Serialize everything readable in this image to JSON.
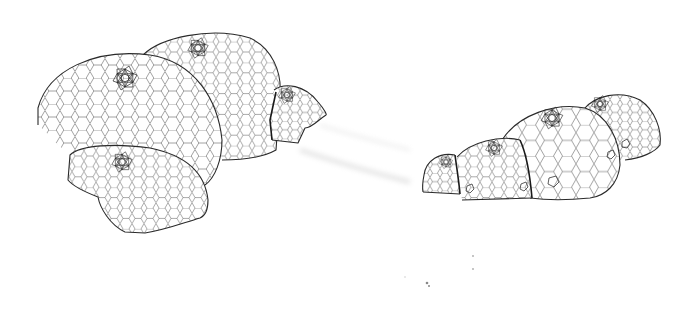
{
  "image": {
    "description": "Line drawing of two clusters of geodesic domes with hexagonal panel patterns",
    "background": "#ffffff",
    "line_color": "#2a2a2a"
  },
  "clusters": [
    {
      "name": "left-cluster",
      "domes": [
        {
          "id": "A",
          "label": "large front-left dome",
          "bbox": [
            38,
            52,
            222,
            185
          ],
          "cap": [
            125,
            78
          ],
          "cap_scale": 1.0
        },
        {
          "id": "B",
          "label": "rear dome",
          "bbox": [
            143,
            30,
            280,
            160
          ],
          "cap": [
            198,
            48
          ],
          "cap_scale": 0.85
        },
        {
          "id": "C",
          "label": "small cut dome right",
          "bbox": [
            270,
            83,
            327,
            143
          ],
          "cap": [
            287,
            95
          ],
          "cap_scale": 0.7
        },
        {
          "id": "D",
          "label": "front cut dome",
          "bbox": [
            66,
            145,
            210,
            233
          ],
          "cap": [
            122,
            162
          ],
          "cap_scale": 0.85
        }
      ]
    },
    {
      "name": "right-cluster",
      "domes": [
        {
          "id": "E",
          "label": "smallest dome",
          "bbox": [
            423,
            153,
            460,
            195
          ],
          "cap": [
            446,
            162
          ],
          "cap_scale": 0.55
        },
        {
          "id": "F",
          "label": "small dome",
          "bbox": [
            455,
            135,
            533,
            200
          ],
          "cap": [
            494,
            148
          ],
          "cap_scale": 0.7
        },
        {
          "id": "G",
          "label": "large dome",
          "bbox": [
            502,
            103,
            620,
            200
          ],
          "cap": [
            552,
            118
          ],
          "cap_scale": 0.9
        },
        {
          "id": "H",
          "label": "rear dome",
          "bbox": [
            583,
            93,
            660,
            160
          ],
          "cap": [
            600,
            104
          ],
          "cap_scale": 0.7
        }
      ]
    }
  ],
  "artifacts": {
    "smudge_between_clusters": [
      [
        300,
        140
      ],
      [
        420,
        185
      ]
    ],
    "dots": [
      [
        405,
        277
      ],
      [
        427,
        283
      ],
      [
        429,
        286
      ],
      [
        473,
        256
      ],
      [
        473,
        269
      ]
    ]
  }
}
